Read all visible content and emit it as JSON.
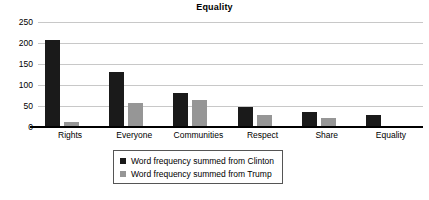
{
  "chart_data": {
    "type": "bar",
    "title": "Equality",
    "xlabel": "",
    "ylabel": "",
    "ylim": [
      0,
      250
    ],
    "yticks": [
      0,
      50,
      100,
      150,
      200,
      250
    ],
    "grid": true,
    "legend_position": "bottom-center",
    "categories": [
      "Rights",
      "Everyone",
      "Communities",
      "Respect",
      "Share",
      "Equality"
    ],
    "series": [
      {
        "name": "Word frequency summed from Clinton",
        "color": "#1a1a1a",
        "values": [
          208,
          131,
          80,
          47,
          36,
          28
        ]
      },
      {
        "name": "Word frequency summed from Trump",
        "color": "#969696",
        "values": [
          13,
          58,
          64,
          28,
          22,
          1
        ]
      }
    ]
  },
  "legend": {
    "entries": [
      {
        "label": "Word frequency summed from Clinton",
        "swatch": "black-square"
      },
      {
        "label": "Word frequency summed from Trump",
        "swatch": "grey-square"
      }
    ]
  },
  "colors": {
    "clinton_bar": "#1a1a1a",
    "trump_bar": "#969696",
    "gridline": "#c8c8c8",
    "axis": "#000000",
    "background": "#ffffff"
  }
}
